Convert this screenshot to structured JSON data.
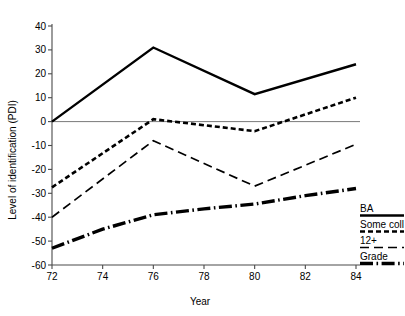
{
  "chart_data": {
    "type": "line",
    "title": "",
    "xlabel": "Year",
    "ylabel": "Level of identification (PDI)",
    "x": [
      72,
      76,
      80,
      84
    ],
    "xticks": [
      "72",
      "74",
      "76",
      "78",
      "80",
      "82",
      "84"
    ],
    "xtick_values": [
      72,
      74,
      76,
      78,
      80,
      82,
      84
    ],
    "yticks": [
      "40",
      "30",
      "20",
      "10",
      "0",
      "-10",
      "-20",
      "-30",
      "-40",
      "-50",
      "-60"
    ],
    "ytick_values": [
      40,
      30,
      20,
      10,
      0,
      -10,
      -20,
      -30,
      -40,
      -50,
      -60
    ],
    "xlim": [
      72,
      84
    ],
    "ylim": [
      -60,
      40
    ],
    "grid": false,
    "zero_reference_line": 0,
    "legend_position": "right",
    "series": [
      {
        "name": "BA",
        "style": "solid",
        "x": [
          72,
          76,
          80,
          84
        ],
        "values": [
          0,
          31,
          11.5,
          24
        ]
      },
      {
        "name": "Some coll",
        "style": "short-dash",
        "x": [
          72,
          76,
          80,
          84
        ],
        "values": [
          -27.5,
          1,
          -4,
          10
        ]
      },
      {
        "name": "12+",
        "style": "long-dash",
        "x": [
          72,
          76,
          80,
          84
        ],
        "values": [
          -40,
          -8,
          -27,
          -9.5
        ]
      },
      {
        "name": "Grade",
        "style": "thick-dash-dot",
        "x": [
          72,
          74,
          76,
          78,
          80,
          82,
          84
        ],
        "values": [
          -53,
          -45,
          -39,
          -36.5,
          -34.5,
          -31,
          -28
        ]
      }
    ]
  },
  "axes": {
    "y_title": "Level of identification (PDI)",
    "x_title": "Year",
    "y_tick_labels": [
      "40",
      "30",
      "20",
      "10",
      "0",
      "-10",
      "-20",
      "-30",
      "-40",
      "-50",
      "-60"
    ],
    "x_tick_labels": [
      "72",
      "74",
      "76",
      "78",
      "80",
      "82",
      "84"
    ]
  },
  "legend": {
    "items": [
      {
        "label": "BA",
        "style": "solid"
      },
      {
        "label": "Some coll",
        "style": "short-dash"
      },
      {
        "label": "12+",
        "style": "long-dash"
      },
      {
        "label": "Grade",
        "style": "thick-dash-dot"
      }
    ]
  },
  "colors": {
    "line": "#000000",
    "axis": "#4a4a4a",
    "zero_line": "#7a7a7a",
    "background": "#ffffff"
  }
}
